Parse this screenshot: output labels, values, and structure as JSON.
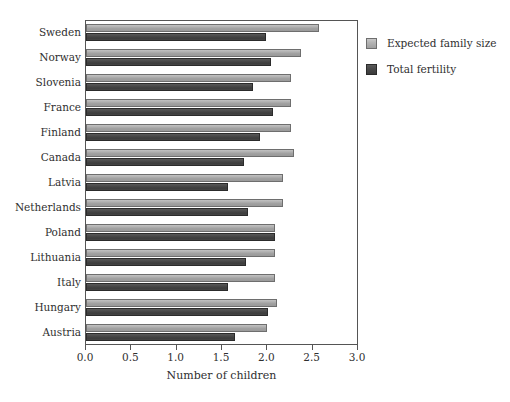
{
  "chart_data": {
    "type": "bar",
    "orientation": "horizontal",
    "title": "",
    "xlabel": "Number of children",
    "ylabel": "",
    "xlim": [
      0.0,
      3.0
    ],
    "xticks": [
      "0.0",
      "0.5",
      "1.0",
      "1.5",
      "2.0",
      "2.5",
      "3.0"
    ],
    "xtick_values": [
      0.0,
      0.5,
      1.0,
      1.5,
      2.0,
      2.5,
      3.0
    ],
    "grid": false,
    "legend_position": "right",
    "categories": [
      "Sweden",
      "Norway",
      "Slovenia",
      "France",
      "Finland",
      "Canada",
      "Latvia",
      "Netherlands",
      "Poland",
      "Lithuania",
      "Italy",
      "Hungary",
      "Austria"
    ],
    "series": [
      {
        "name": "Expected family size",
        "color": "#a8a8a8",
        "values": [
          2.57,
          2.37,
          2.26,
          2.26,
          2.26,
          2.29,
          2.17,
          2.17,
          2.08,
          2.08,
          2.08,
          2.11,
          2.0
        ]
      },
      {
        "name": "Total fertility",
        "color": "#454545",
        "values": [
          1.98,
          2.04,
          1.84,
          2.06,
          1.92,
          1.74,
          1.57,
          1.79,
          2.08,
          1.76,
          1.57,
          2.01,
          1.64
        ]
      }
    ]
  },
  "legend": {
    "items": [
      {
        "label": "Expected family size",
        "swatch": "expected"
      },
      {
        "label": "Total fertility",
        "swatch": "fertility"
      }
    ]
  },
  "axis": {
    "x_title": "Number of children"
  }
}
